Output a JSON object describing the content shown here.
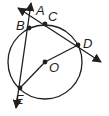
{
  "diagram": {
    "type": "circle-secants",
    "center": {
      "label": "O",
      "x": 45,
      "y": 62
    },
    "radius": 37,
    "points": [
      {
        "label": "A",
        "x": 30,
        "y": 9,
        "label_x": 36,
        "label_y": 15
      },
      {
        "label": "B",
        "x": 29,
        "y": 28,
        "label_x": 16,
        "label_y": 29
      },
      {
        "label": "C",
        "x": 45,
        "y": 24,
        "label_x": 48,
        "label_y": 21
      },
      {
        "label": "D",
        "x": 78,
        "y": 45,
        "label_x": 83,
        "label_y": 48
      },
      {
        "label": "E",
        "x": 20,
        "y": 88,
        "label_x": 15,
        "label_y": 103
      }
    ],
    "lines": [
      {
        "name": "line-ACD",
        "from": [
          18,
          8
        ],
        "to": [
          101,
          62
        ],
        "arrows": "both"
      },
      {
        "name": "line-ABE",
        "from": [
          31,
          3
        ],
        "to": [
          16,
          108
        ],
        "arrows": "both"
      }
    ],
    "segments": [
      {
        "name": "radius-OD",
        "from": "O",
        "to": "D"
      },
      {
        "name": "segment-OE",
        "from": "O",
        "to": "E"
      }
    ],
    "colors": {
      "stroke": "#231f20",
      "background": "#ffffff"
    }
  }
}
